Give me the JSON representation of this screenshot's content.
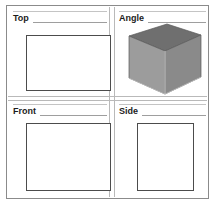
{
  "window": {
    "title": "Orthographic Projection Viewports",
    "width": 216,
    "height": 206,
    "background": "#ffffff",
    "frame_color": "#8b8b8b"
  },
  "colors": {
    "frame_border": "#8b8b8b",
    "divider": "#b9b9b9",
    "label_text": "#1c1c1c",
    "rule_light": "#c4c4c4",
    "rule_dark": "#9e9e9e",
    "rect_outline": "#4c4c4c",
    "box_top_face": "#6f6f6f",
    "box_front_face": "#9a9a9a",
    "box_right_face": "#8a8a8a",
    "box_edge": "#bdbdbd",
    "box_outline": "#5a5a5a"
  },
  "panes": [
    {
      "id": "top",
      "label": "Top",
      "shape": "rectangle",
      "orientation": "landscape"
    },
    {
      "id": "angle",
      "label": "Angle",
      "shape": "perspective-box",
      "orientation": "isometric"
    },
    {
      "id": "front",
      "label": "Front",
      "shape": "rectangle",
      "orientation": "square"
    },
    {
      "id": "side",
      "label": "Side",
      "shape": "rectangle",
      "orientation": "portrait"
    }
  ],
  "icons": {
    "box_3d": "cube-icon"
  }
}
